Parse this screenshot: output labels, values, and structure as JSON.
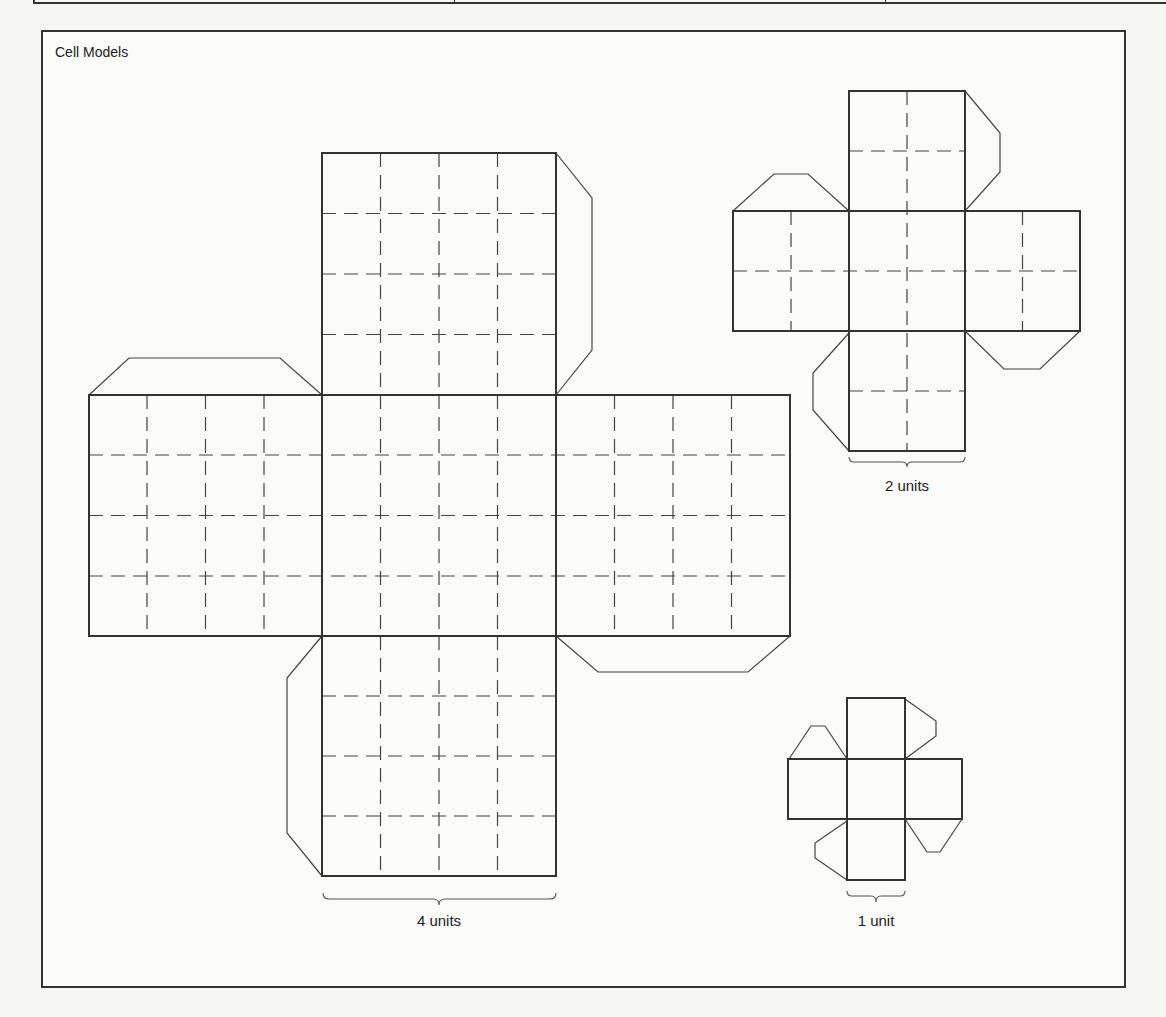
{
  "top_strip": {
    "dividers_x": [
      452,
      883
    ]
  },
  "frame": {
    "title": "Cell Models"
  },
  "models": [
    {
      "id": "large",
      "label": "4 units",
      "grid": 4
    },
    {
      "id": "medium",
      "label": "2 units",
      "grid": 2
    },
    {
      "id": "small",
      "label": "1 unit",
      "grid": 1
    }
  ],
  "colors": {
    "line": "#333333",
    "paper": "#fbfbfa",
    "background": "#f6f6f4"
  }
}
